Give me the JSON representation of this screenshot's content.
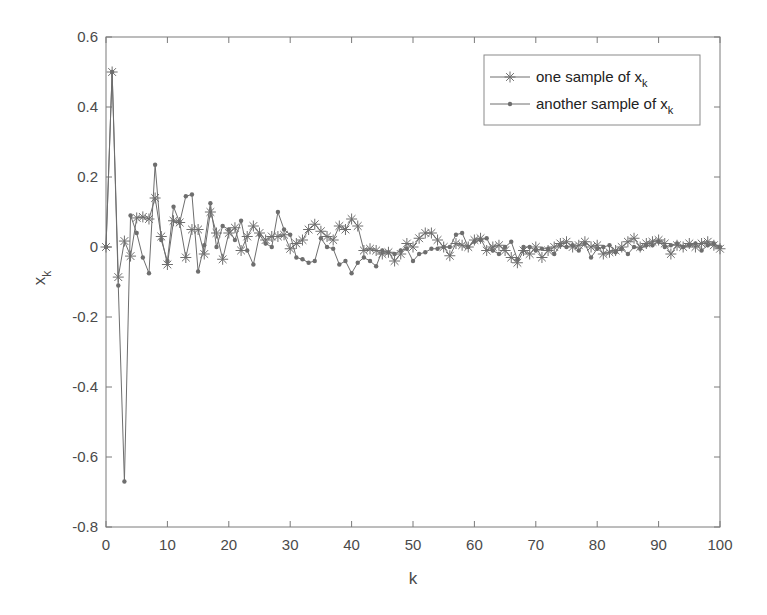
{
  "chart_data": {
    "type": "line",
    "title": "",
    "xlabel": "k",
    "ylabel": "x",
    "ylabel_subscript": "k",
    "xlim": [
      0,
      100
    ],
    "ylim": [
      -0.8,
      0.6
    ],
    "xticks": [
      0,
      10,
      20,
      30,
      40,
      50,
      60,
      70,
      80,
      90,
      100
    ],
    "yticks": [
      -0.8,
      -0.6,
      -0.4,
      -0.2,
      0,
      0.2,
      0.4,
      0.6
    ],
    "xtick_labels": [
      "0",
      "10",
      "20",
      "30",
      "40",
      "50",
      "60",
      "70",
      "80",
      "90",
      "100"
    ],
    "ytick_labels": [
      "-0.8",
      "-0.6",
      "-0.4",
      "-0.2",
      "0",
      "0.2",
      "0.4",
      "0.6"
    ],
    "grid": false,
    "legend_position": "upper right",
    "x": [
      0,
      1,
      2,
      3,
      4,
      5,
      6,
      7,
      8,
      9,
      10,
      11,
      12,
      13,
      14,
      15,
      16,
      17,
      18,
      19,
      20,
      21,
      22,
      23,
      24,
      25,
      26,
      27,
      28,
      29,
      30,
      31,
      32,
      33,
      34,
      35,
      36,
      37,
      38,
      39,
      40,
      41,
      42,
      43,
      44,
      45,
      46,
      47,
      48,
      49,
      50,
      51,
      52,
      53,
      54,
      55,
      56,
      57,
      58,
      59,
      60,
      61,
      62,
      63,
      64,
      65,
      66,
      67,
      68,
      69,
      70,
      71,
      72,
      73,
      74,
      75,
      76,
      77,
      78,
      79,
      80,
      81,
      82,
      83,
      84,
      85,
      86,
      87,
      88,
      89,
      90,
      91,
      92,
      93,
      94,
      95,
      96,
      97,
      98,
      99,
      100
    ],
    "series": [
      {
        "name": "one sample of x_k",
        "legend_label": "one sample of x",
        "legend_subscript": "k",
        "marker": "star",
        "color": "#6e6e6e",
        "values": [
          0,
          0.5,
          -0.086,
          0.017,
          -0.026,
          0.083,
          0.086,
          0.08,
          0.14,
          0.03,
          -0.05,
          0.075,
          0.07,
          -0.03,
          0.05,
          0.05,
          -0.02,
          0.1,
          0.04,
          -0.035,
          0.04,
          0.055,
          -0.01,
          0.03,
          0.06,
          0.04,
          0.02,
          0.03,
          0.03,
          0.035,
          -0.005,
          0.01,
          0.02,
          0.05,
          0.065,
          0.045,
          0.03,
          0.02,
          0.06,
          0.05,
          0.08,
          0.06,
          -0.01,
          -0.005,
          -0.01,
          -0.02,
          -0.015,
          -0.04,
          -0.02,
          0.01,
          0.0,
          0.025,
          0.04,
          0.04,
          0.02,
          0.0,
          -0.025,
          0.01,
          0.005,
          0.0,
          0.02,
          0.025,
          -0.01,
          0.0,
          0.005,
          -0.01,
          -0.03,
          -0.045,
          -0.01,
          -0.02,
          0.0,
          -0.03,
          -0.01,
          0.0,
          0.01,
          0.015,
          0.0,
          0.005,
          0.015,
          0.0,
          0.005,
          -0.02,
          -0.015,
          -0.01,
          0.0,
          0.015,
          0.025,
          0.0,
          0.01,
          0.015,
          0.02,
          0.01,
          -0.02,
          0.005,
          0.0,
          0.01,
          0.0,
          0.01,
          0.015,
          0.005,
          -0.005
        ]
      },
      {
        "name": "another sample of x_k",
        "legend_label": "another sample of x",
        "legend_subscript": "k",
        "marker": "dot",
        "color": "#6e6e6e",
        "values": [
          0,
          0.5,
          -0.11,
          -0.67,
          0.09,
          0.04,
          -0.03,
          -0.075,
          0.235,
          0.02,
          -0.04,
          0.115,
          0.07,
          0.145,
          0.15,
          -0.07,
          0.005,
          0.125,
          0.0,
          0.06,
          0.05,
          0.02,
          0.075,
          -0.01,
          -0.05,
          0.035,
          0.01,
          0.0,
          0.1,
          0.05,
          0.035,
          -0.03,
          -0.035,
          -0.045,
          -0.04,
          0.025,
          0.0,
          -0.005,
          -0.05,
          -0.04,
          -0.075,
          -0.045,
          -0.03,
          -0.04,
          -0.055,
          -0.01,
          -0.015,
          -0.02,
          -0.01,
          -0.005,
          -0.04,
          -0.02,
          -0.015,
          -0.005,
          -0.005,
          0.0,
          0.0,
          0.035,
          0.04,
          0.0,
          0.015,
          0.02,
          0.025,
          -0.01,
          -0.02,
          0.0,
          0.015,
          -0.035,
          0.0,
          0.0,
          -0.01,
          -0.005,
          -0.005,
          -0.02,
          0.005,
          0.0,
          0.005,
          -0.01,
          0.01,
          -0.03,
          -0.005,
          0.0,
          0.005,
          -0.015,
          -0.005,
          -0.02,
          0.0,
          -0.005,
          0.005,
          0.005,
          0.015,
          0.0,
          0.005,
          0.01,
          0.0,
          0.005,
          0.01,
          -0.01,
          0.005,
          0.01,
          0.0
        ]
      }
    ]
  },
  "legend": {
    "items": [
      {
        "label": "one sample of x",
        "subscript": "k"
      },
      {
        "label": "another sample of x",
        "subscript": "k"
      }
    ]
  },
  "axes": {
    "xlabel": "k",
    "ylabel": "x",
    "ylabel_subscript": "k"
  }
}
